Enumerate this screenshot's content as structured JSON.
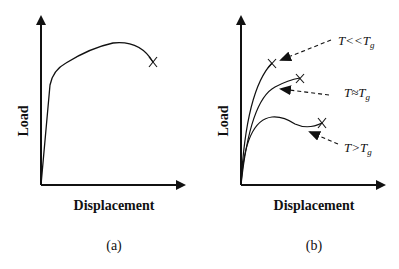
{
  "figure": {
    "panels": [
      {
        "id": "a",
        "caption": "(a)",
        "xlabel": "Displacement",
        "ylabel": "Load"
      },
      {
        "id": "b",
        "caption": "(b)",
        "xlabel": "Displacement",
        "ylabel": "Load",
        "annotations": [
          {
            "prefix": "T<<T",
            "sub": "g"
          },
          {
            "prefix": "T≈T",
            "sub": "g"
          },
          {
            "prefix": "T>T",
            "sub": "g"
          }
        ]
      }
    ],
    "colors": {
      "ink": "#111111",
      "background": "#ffffff"
    },
    "markers": {
      "failure": "X"
    }
  }
}
